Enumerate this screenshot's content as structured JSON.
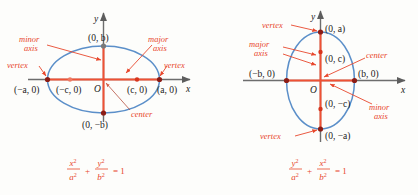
{
  "figure": {
    "background": "#fdfdfb",
    "colors": {
      "ellipse_stroke": "#5b8fc9",
      "accent_red": "#e8472c",
      "axis_gray": "#6d6d6d",
      "point_dark": "#8c1d16",
      "label_dark": "#1a1a1a"
    }
  },
  "left_diagram": {
    "name": "horizontal-ellipse",
    "equation": {
      "num1": "x",
      "den1": "a",
      "plus": "+",
      "num2": "y",
      "den2": "b",
      "equals": "= 1",
      "sup": "2"
    },
    "axis_labels": {
      "x": "x",
      "y": "y",
      "origin": "O"
    },
    "points": [
      {
        "id": "vertex-left",
        "label": "(−a, 0)"
      },
      {
        "id": "focus-left",
        "label": "(−c, 0)"
      },
      {
        "id": "focus-right",
        "label": "(c, 0)"
      },
      {
        "id": "vertex-right",
        "label": "(a, 0)"
      },
      {
        "id": "covertex-top",
        "label": "(0, b)"
      },
      {
        "id": "covertex-bottom",
        "label": "(0, −b)"
      }
    ],
    "annotations": [
      {
        "id": "minor-axis",
        "line1": "minor",
        "line2": "axis"
      },
      {
        "id": "major-axis",
        "line1": "major",
        "line2": "axis"
      },
      {
        "id": "vertex-left-note",
        "line1": "vertex",
        "line2": ""
      },
      {
        "id": "vertex-right-note",
        "line1": "vertex",
        "line2": ""
      },
      {
        "id": "center-note",
        "line1": "center",
        "line2": ""
      }
    ]
  },
  "right_diagram": {
    "name": "vertical-ellipse",
    "equation": {
      "num1": "y",
      "den1": "a",
      "plus": "+",
      "num2": "x",
      "den2": "b",
      "equals": "= 1",
      "sup": "2"
    },
    "axis_labels": {
      "x": "x",
      "y": "y",
      "origin": "O"
    },
    "points": [
      {
        "id": "vertex-top",
        "label": "(0, a)"
      },
      {
        "id": "focus-top",
        "label": "(0, c)"
      },
      {
        "id": "focus-bottom",
        "label": "(0, −c)"
      },
      {
        "id": "vertex-bottom",
        "label": "(0, −a)"
      },
      {
        "id": "covertex-left",
        "label": "(−b, 0)"
      },
      {
        "id": "covertex-right",
        "label": "(b, 0)"
      }
    ],
    "annotations": [
      {
        "id": "vertex-top-note",
        "line1": "vertex",
        "line2": ""
      },
      {
        "id": "major-axis",
        "line1": "major",
        "line2": "axis"
      },
      {
        "id": "center-note",
        "line1": "center",
        "line2": ""
      },
      {
        "id": "minor-axis",
        "line1": "minor",
        "line2": "axis"
      },
      {
        "id": "vertex-bottom-note",
        "line1": "vertex",
        "line2": ""
      }
    ]
  }
}
